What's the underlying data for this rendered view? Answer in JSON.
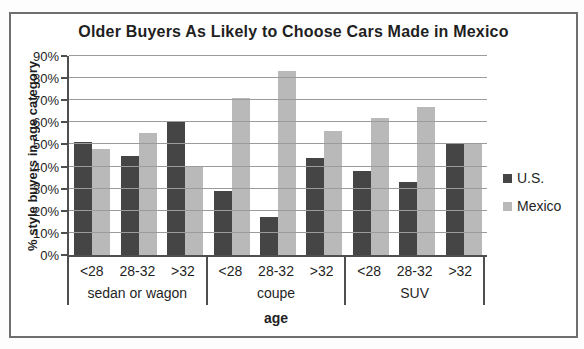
{
  "chart_data": {
    "type": "bar",
    "title": "Older Buyers As Likely to Choose Cars Made in Mexico",
    "ylabel": "% style buyers in age category",
    "xlabel": "age",
    "ylim": [
      0,
      90
    ],
    "grid": true,
    "legend_position": "right",
    "ytick_values": [
      0,
      10,
      20,
      30,
      40,
      50,
      60,
      70,
      80,
      90
    ],
    "ytick_labels": [
      "0%",
      "10%",
      "20%",
      "30%",
      "40%",
      "50%",
      "60%",
      "70%",
      "80%",
      "90%"
    ],
    "group_labels": [
      "sedan or wagon",
      "coupe",
      "SUV"
    ],
    "age_labels": [
      "<28",
      "28-32",
      ">32"
    ],
    "series": [
      {
        "name": "U.S.",
        "color": "#454545",
        "values_by_group": [
          [
            51,
            45,
            60
          ],
          [
            29,
            17,
            44
          ],
          [
            38,
            33,
            50
          ]
        ]
      },
      {
        "name": "Mexico",
        "color": "#b9b9b9",
        "values_by_group": [
          [
            48,
            55,
            40
          ],
          [
            71,
            83,
            56
          ],
          [
            62,
            67,
            50
          ]
        ]
      }
    ]
  },
  "colors": {
    "us_bar": "#454545",
    "mexico_bar": "#b9b9b9",
    "gridline": "#9b9b9b",
    "axis": "#4f4f4f",
    "frame_border": "#6f6f6f",
    "text": "#1f1f1f"
  }
}
